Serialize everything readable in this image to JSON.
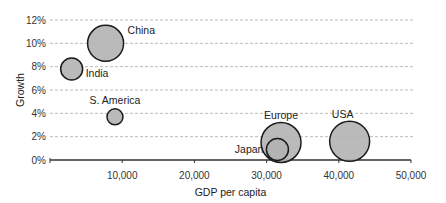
{
  "chart_data": {
    "type": "bubble",
    "title": "",
    "xlabel": "GDP per capita",
    "ylabel": "Growth",
    "xlim": [
      0,
      50000
    ],
    "ylim": [
      0,
      12
    ],
    "x_ticks": [
      "10,000",
      "20,000",
      "30,000",
      "40,000",
      "50,000"
    ],
    "y_ticks": [
      "0%",
      "2%",
      "4%",
      "6%",
      "8%",
      "10%",
      "12%"
    ],
    "grid": "horizontal dashed",
    "legend": "none",
    "points": [
      {
        "label": "China",
        "x": 7700,
        "y": 10.0,
        "size": 18
      },
      {
        "label": "India",
        "x": 3000,
        "y": 7.8,
        "size": 11
      },
      {
        "label": "S. America",
        "x": 9000,
        "y": 3.7,
        "size": 8
      },
      {
        "label": "Europe",
        "x": 32000,
        "y": 1.5,
        "size": 20
      },
      {
        "label": "Japan",
        "x": 31500,
        "y": 0.9,
        "size": 11
      },
      {
        "label": "USA",
        "x": 41500,
        "y": 1.6,
        "size": 20
      }
    ],
    "colors": {
      "bubble_fill": "#b3b3b3",
      "bubble_stroke": "#1a1a1a",
      "grid": "#aaaaaa",
      "axis": "#333333"
    }
  }
}
